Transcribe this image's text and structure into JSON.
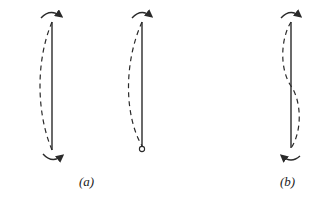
{
  "figure": {
    "panels": [
      {
        "id": "a-fixed-fixed",
        "label": "",
        "top_end": "rotation-restrained",
        "bottom_end": "rotation-restrained",
        "mode": "single-curvature"
      },
      {
        "id": "a-fixed-pinned",
        "label": "",
        "top_end": "rotation-restrained",
        "bottom_end": "pinned",
        "mode": "single-curvature"
      },
      {
        "id": "b-fixed-fixed",
        "label": "",
        "top_end": "rotation-restrained",
        "bottom_end": "rotation-restrained",
        "mode": "double-curvature"
      }
    ],
    "labels": {
      "a": "(a)",
      "b": "(b)"
    },
    "colors": {
      "stroke": "#2a2a2a",
      "background": "#ffffff"
    }
  }
}
